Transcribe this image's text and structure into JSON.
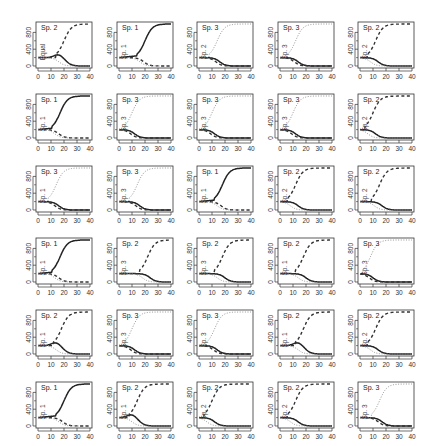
{
  "chart_data": {
    "type": "line",
    "layout": {
      "rows": 6,
      "cols": 5
    },
    "x_ticks": [
      0,
      10,
      20,
      30,
      40
    ],
    "y_ticks": [
      0,
      400,
      800
    ],
    "xlim": [
      0,
      40
    ],
    "ylim": [
      0,
      1000
    ],
    "series_styles": {
      "Sp. 1": "solid",
      "Sp. 2": "dashed",
      "Sp. 3": "dotted"
    },
    "panels": [
      {
        "title": "Sp. 2",
        "ylabel": "Equal",
        "winner": 2,
        "mid": 20,
        "start": 200,
        "shape": "hump"
      },
      {
        "title": "Sp. 1",
        "ylabel": "Sp. 1",
        "winner": 1,
        "mid": 20,
        "start": 200,
        "shape": "hump"
      },
      {
        "title": "Sp. 3",
        "ylabel": "Sp. 2",
        "winner": 3,
        "mid": 14,
        "start": 200,
        "shape": "flat"
      },
      {
        "title": "Sp. 3",
        "ylabel": "Sp. 3",
        "winner": 3,
        "mid": 12,
        "start": 200,
        "shape": "flat"
      },
      {
        "title": "Sp. 2",
        "ylabel": "Sp. 2",
        "winner": 2,
        "mid": 12,
        "start": 200,
        "shape": "flat"
      },
      {
        "title": "Sp. 1",
        "ylabel": "Sp. 1",
        "winner": 1,
        "mid": 17,
        "start": 200,
        "shape": "hump"
      },
      {
        "title": "Sp. 3",
        "ylabel": "Sp. 3",
        "winner": 3,
        "mid": 10,
        "start": 200,
        "shape": "flat"
      },
      {
        "title": "Sp. 3",
        "ylabel": "Sp. 3",
        "winner": 3,
        "mid": 10,
        "start": 200,
        "shape": "flat"
      },
      {
        "title": "Sp. 3",
        "ylabel": "Sp. 3",
        "winner": 3,
        "mid": 10,
        "start": 200,
        "shape": "flat"
      },
      {
        "title": "Sp. 2",
        "ylabel": "Sp. 2",
        "winner": 2,
        "mid": 10,
        "start": 200,
        "shape": "flat"
      },
      {
        "title": "Sp. 3",
        "ylabel": "Sp. 1",
        "winner": 3,
        "mid": 14,
        "start": 200,
        "shape": "flat"
      },
      {
        "title": "Sp. 3",
        "ylabel": "Sp. 3",
        "winner": 3,
        "mid": 14,
        "start": 200,
        "shape": "flat"
      },
      {
        "title": "Sp. 1",
        "ylabel": "Sp. 1",
        "winner": 1,
        "mid": 18,
        "start": 200,
        "shape": "hump"
      },
      {
        "title": "Sp. 2",
        "ylabel": "Sp. 2",
        "winner": 2,
        "mid": 12,
        "start": 200,
        "shape": "flat"
      },
      {
        "title": "Sp. 2",
        "ylabel": "Sp. 2",
        "winner": 2,
        "mid": 15,
        "start": 200,
        "shape": "flat"
      },
      {
        "title": "Sp. 1",
        "ylabel": "Sp. 1",
        "winner": 1,
        "mid": 17,
        "start": 200,
        "shape": "hump"
      },
      {
        "title": "Sp. 2",
        "ylabel": "Sp. 3",
        "winner": 2,
        "mid": 22,
        "start": 200,
        "shape": "flat"
      },
      {
        "title": "Sp. 2",
        "ylabel": "Sp. 3",
        "winner": 2,
        "mid": 18,
        "start": 200,
        "shape": "flat"
      },
      {
        "title": "Sp. 2",
        "ylabel": "Sp. 1",
        "winner": 2,
        "mid": 18,
        "start": 200,
        "shape": "flat"
      },
      {
        "title": "Sp. 3",
        "ylabel": "Sp. 3",
        "winner": 3,
        "mid": 8,
        "start": 200,
        "shape": "flat"
      },
      {
        "title": "Sp. 2",
        "ylabel": "Sp. 1",
        "winner": 2,
        "mid": 18,
        "start": 200,
        "shape": "hump"
      },
      {
        "title": "Sp. 3",
        "ylabel": "Sp. 3",
        "winner": 3,
        "mid": 10,
        "start": 200,
        "shape": "flat"
      },
      {
        "title": "Sp. 3",
        "ylabel": "Sp. 3",
        "winner": 3,
        "mid": 12,
        "start": 200,
        "shape": "flat"
      },
      {
        "title": "Sp. 2",
        "ylabel": "Sp. 1",
        "winner": 2,
        "mid": 18,
        "start": 200,
        "shape": "hump"
      },
      {
        "title": "Sp. 2",
        "ylabel": "Sp. 2",
        "winner": 2,
        "mid": 12,
        "start": 200,
        "shape": "flat"
      },
      {
        "title": "Sp. 1",
        "ylabel": "Sp. 1",
        "winner": 1,
        "mid": 20,
        "start": 200,
        "shape": "hump"
      },
      {
        "title": "Sp. 2",
        "ylabel": "Sp. 1",
        "winner": 2,
        "mid": 14,
        "start": 200,
        "shape": "hump"
      },
      {
        "title": "Sp. 2",
        "ylabel": "Sp. 2",
        "winner": 2,
        "mid": 10,
        "start": 200,
        "shape": "flat"
      },
      {
        "title": "Sp. 2",
        "ylabel": "Sp. 2",
        "winner": 2,
        "mid": 12,
        "start": 200,
        "shape": "flat"
      },
      {
        "title": "Sp. 3",
        "ylabel": "Sp. 3",
        "winner": 3,
        "mid": 15,
        "start": 200,
        "shape": "flat"
      }
    ]
  }
}
